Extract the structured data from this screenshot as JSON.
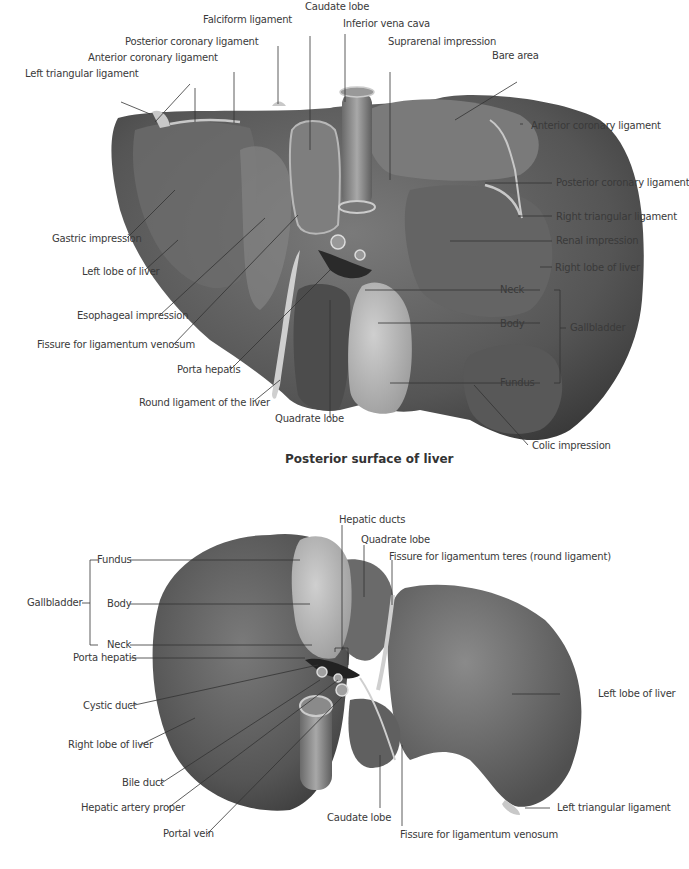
{
  "figures": [
    {
      "id": "posterior",
      "caption": "Posterior surface of liver",
      "labels": {
        "caudate_lobe": "Caudate lobe",
        "falciform_ligament": "Falciform ligament",
        "inferior_vena_cava": "Inferior vena cava",
        "posterior_coronary_ligament_left": "Posterior coronary ligament",
        "suprarenal_impression": "Suprarenal impression",
        "anterior_coronary_ligament_left": "Anterior coronary ligament",
        "bare_area": "Bare area",
        "left_triangular_ligament": "Left triangular ligament",
        "anterior_coronary_ligament_right": "Anterior coronary ligament",
        "posterior_coronary_ligament_right": "Posterior coronary ligament",
        "right_triangular_ligament": "Right triangular ligament",
        "gastric_impression": "Gastric impression",
        "renal_impression": "Renal impression",
        "left_lobe_of_liver": "Left lobe of liver",
        "right_lobe_of_liver": "Right lobe of liver",
        "neck": "Neck",
        "esophageal_impression": "Esophageal impression",
        "body": "Body",
        "gallbladder": "Gallbladder",
        "fissure_ligamentum_venosum": "Fissure for ligamentum venosum",
        "porta_hepatis": "Porta hepatis",
        "fundus": "Fundus",
        "round_ligament": "Round ligament of the liver",
        "quadrate_lobe": "Quadrate lobe",
        "colic_impression": "Colic impression"
      }
    },
    {
      "id": "inferior",
      "caption": "",
      "labels": {
        "hepatic_ducts": "Hepatic ducts",
        "quadrate_lobe": "Quadrate lobe",
        "fissure_ligamentum_teres": "Fissure for ligamentum teres (round ligament)",
        "fundus": "Fundus",
        "gallbladder": "Gallbladder",
        "body": "Body",
        "neck": "Neck",
        "porta_hepatis": "Porta hepatis",
        "left_lobe_of_liver": "Left lobe of liver",
        "cystic_duct": "Cystic duct",
        "right_lobe_of_liver": "Right lobe of liver",
        "bile_duct": "Bile duct",
        "hepatic_artery_proper": "Hepatic artery proper",
        "portal_vein": "Portal vein",
        "caudate_lobe": "Caudate lobe",
        "left_triangular_ligament": "Left triangular ligament",
        "fissure_ligamentum_venosum": "Fissure for ligamentum venosum"
      }
    }
  ],
  "colors": {
    "liver_dark": "#4a4a4a",
    "liver_mid": "#6e6e6e",
    "liver_light": "#9a9a9a",
    "gallbladder": "#b4b4b4",
    "ligament": "#c8c8c8",
    "leader_line": "#333333",
    "label_text": "#3a3a3a"
  }
}
